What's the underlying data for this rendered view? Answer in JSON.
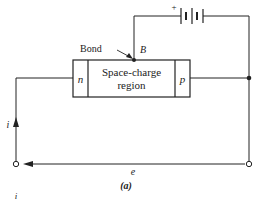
{
  "diagram": {
    "device": {
      "left_region": "n",
      "center_line1": "Space-charge",
      "center_line2": "region",
      "right_region": "p"
    },
    "bond_label": "Bond",
    "bond_point_label": "B",
    "battery_polarity": "+",
    "current_label": "i",
    "emf_label": "e",
    "caption": "(a)",
    "bottom_partial_label": "i"
  },
  "colors": {
    "line": "#222222",
    "background": "#ffffff"
  }
}
